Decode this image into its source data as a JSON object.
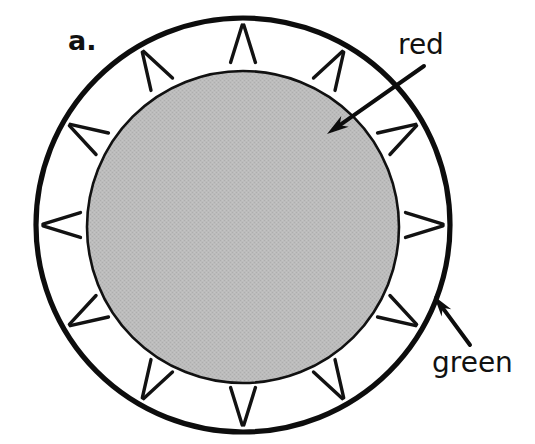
{
  "figure": {
    "panel_label": "a.",
    "width": 535,
    "height": 444,
    "background_color": "#ffffff"
  },
  "diagram": {
    "type": "cross-section-ring",
    "outer_circle": {
      "name": "outer-membrane-circle",
      "cx": 243,
      "cy": 225,
      "r": 207,
      "stroke_color": "#0d0d0d",
      "stroke_width": 5.2,
      "fill_color": "#ffffff"
    },
    "inner_circle": {
      "name": "inner-core-circle",
      "cx": 243,
      "cy": 227,
      "r": 156,
      "stroke_color": "#111111",
      "stroke_width": 2.6,
      "fill_color": "#b8b8b8"
    },
    "tick_marks": {
      "name": "radial-tick-pairs",
      "count": 12,
      "angle_step_degrees": 30,
      "start_angle_degrees": -90,
      "pair_splay_degrees": 4.6,
      "inner_radius": 163,
      "outer_radius": 200,
      "stroke_color": "#121212",
      "stroke_width": 3.4
    }
  },
  "annotations": [
    {
      "id": "red",
      "label": "red",
      "label_x": 398,
      "label_y": 54,
      "target": "inner-core-circle",
      "arrow": {
        "x1": 424,
        "y1": 66,
        "x2": 327,
        "y2": 134,
        "stroke_color": "#0d0d0d",
        "stroke_width": 4.0,
        "head_length": 22,
        "head_width": 13
      }
    },
    {
      "id": "green",
      "label": "green",
      "label_x": 432,
      "label_y": 372,
      "target": "outer-membrane-circle",
      "arrow": {
        "x1": 470,
        "y1": 345,
        "x2": 434,
        "y2": 296,
        "stroke_color": "#0d0d0d",
        "stroke_width": 4.0,
        "head_length": 21,
        "head_width": 12
      }
    }
  ],
  "colors": {
    "core_gray": "#b8b8b8",
    "ink_black": "#0d0d0d",
    "ring_white": "#ffffff"
  }
}
